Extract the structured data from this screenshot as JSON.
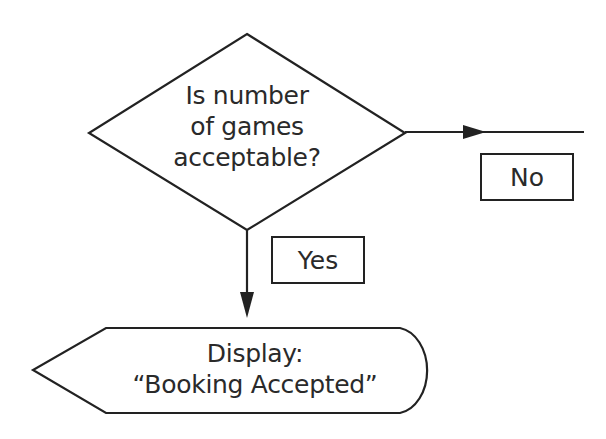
{
  "diagram": {
    "type": "flowchart",
    "decision": {
      "lines": [
        "Is number",
        "of games",
        "acceptable?"
      ]
    },
    "branches": {
      "no_label": "No",
      "yes_label": "Yes"
    },
    "display": {
      "lines": [
        "Display:",
        "“Booking Accepted”"
      ]
    },
    "colors": {
      "stroke": "#222222",
      "text": "#2a2a2a",
      "background": "#ffffff"
    }
  }
}
